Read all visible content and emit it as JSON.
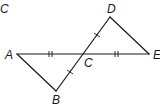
{
  "figure": {
    "partial_label": "C",
    "points": {
      "A": {
        "label": "A",
        "x": 17,
        "y": 54
      },
      "B": {
        "label": "B",
        "x": 56,
        "y": 91
      },
      "C": {
        "label": "C",
        "x": 84,
        "y": 54
      },
      "D": {
        "label": "D",
        "x": 110,
        "y": 17
      },
      "E": {
        "label": "E",
        "x": 149,
        "y": 54
      }
    },
    "segments": [
      "AE",
      "BD",
      "AB",
      "DE"
    ],
    "congruence_marks": [
      {
        "segment": "AC",
        "ticks": 2
      },
      {
        "segment": "CE",
        "ticks": 2
      },
      {
        "segment": "BC",
        "ticks": 1
      },
      {
        "segment": "CD",
        "ticks": 1
      }
    ]
  }
}
